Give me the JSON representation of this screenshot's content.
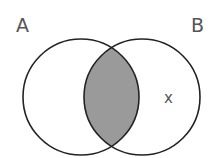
{
  "diagram": {
    "type": "venn",
    "sets": [
      {
        "label": "A",
        "cx": 81,
        "cy": 97,
        "r": 58
      },
      {
        "label": "B",
        "cx": 142,
        "cy": 97,
        "r": 58
      }
    ],
    "shaded_region": "A ∩ B",
    "element_marker": {
      "label": "x",
      "region": "B only"
    }
  },
  "colors": {
    "outline": "#222222",
    "shade": "#9a9a9a",
    "label": "#555555",
    "background": "#ffffff"
  }
}
